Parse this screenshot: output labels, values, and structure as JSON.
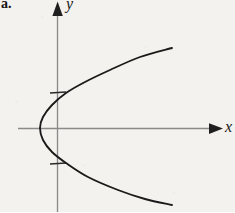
{
  "figure": {
    "part_label": "a.",
    "background_color": "#f4f2ee",
    "width": 235,
    "height": 212
  },
  "axes": {
    "x_label": "x",
    "y_label": "y",
    "axis_color": "#8a8a8a",
    "x_axis": {
      "name": "horizontal-axis",
      "y_position": 128,
      "x_start": 18,
      "x_end": 222,
      "arrow": "right"
    },
    "y_axis": {
      "name": "vertical-axis",
      "x_position": 57,
      "y_start": 2,
      "y_end": 212,
      "arrow": "up"
    },
    "origin": {
      "x": 57,
      "y": 128
    },
    "ticks": [
      {
        "name": "tick-upper",
        "axis": "y",
        "x": 57,
        "y": 93
      },
      {
        "name": "tick-lower",
        "axis": "y",
        "x": 57,
        "y": 163
      }
    ]
  },
  "chart_data": {
    "type": "line",
    "title": "",
    "xlabel": "x",
    "ylabel": "y",
    "curve_color": "#1a1a1a",
    "vertex": {
      "x": 40,
      "y": 128
    },
    "opens": "right",
    "endpoints": [
      {
        "x": 172,
        "y": 48
      },
      {
        "x": 172,
        "y": 205
      }
    ],
    "y_axis_intercepts": [
      {
        "x": 57,
        "y": 93
      },
      {
        "x": 57,
        "y": 163
      }
    ],
    "points": [
      {
        "x": 172,
        "y": 48
      },
      {
        "x": 140,
        "y": 57
      },
      {
        "x": 110,
        "y": 70
      },
      {
        "x": 85,
        "y": 82
      },
      {
        "x": 66,
        "y": 93
      },
      {
        "x": 52,
        "y": 105
      },
      {
        "x": 43,
        "y": 117
      },
      {
        "x": 40,
        "y": 128
      },
      {
        "x": 43,
        "y": 140
      },
      {
        "x": 52,
        "y": 152
      },
      {
        "x": 66,
        "y": 163
      },
      {
        "x": 88,
        "y": 177
      },
      {
        "x": 118,
        "y": 190
      },
      {
        "x": 145,
        "y": 199
      },
      {
        "x": 172,
        "y": 205
      }
    ],
    "grid": false,
    "legend": false
  }
}
